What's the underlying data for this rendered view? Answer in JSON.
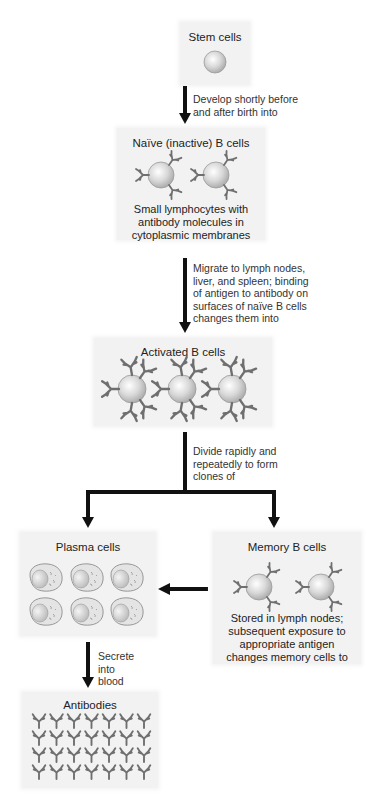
{
  "stem": {
    "title": "Stem cells",
    "arrow_label": [
      "Develop shortly before",
      "and after birth into"
    ]
  },
  "naive": {
    "title": "Naïve (inactive) B cells",
    "desc": [
      "Small lymphocytes with",
      "antibody molecules in",
      "cytoplasmic membranes"
    ],
    "arrow_label": [
      "Migrate to lymph nodes,",
      "liver, and spleen; binding",
      "of antigen to antibody on",
      "surfaces of naïve B cells",
      "changes them into"
    ]
  },
  "activated": {
    "title": "Activated B cells",
    "arrow_label": [
      "Divide rapidly and",
      "repeatedly to form",
      "clones of"
    ]
  },
  "plasma": {
    "title": "Plasma cells",
    "arrow_label": [
      "Secrete",
      "into",
      "blood"
    ]
  },
  "memory": {
    "title": "Memory B cells",
    "desc": [
      "Stored in lymph nodes;",
      "subsequent exposure to",
      "appropriate antigen",
      "changes memory cells to"
    ]
  },
  "antibodies": {
    "title": "Antibodies"
  },
  "colors": {
    "box_bg": "#f2f2f2",
    "arrow": "#111111",
    "cell_fill": "#d9d9d9",
    "antibody": "#6f6f6f"
  }
}
